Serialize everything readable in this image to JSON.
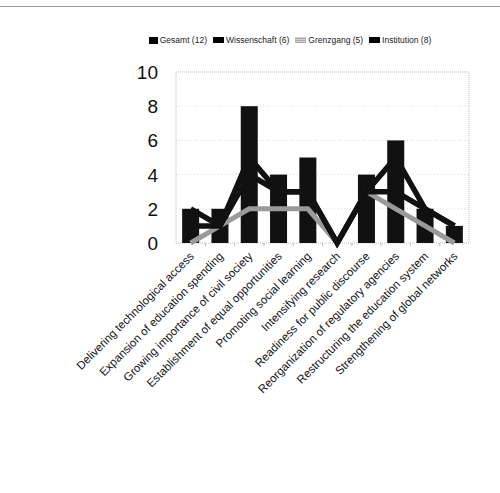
{
  "chart_data": {
    "type": "bar",
    "title": "",
    "xlabel": "",
    "ylabel": "",
    "ylim": [
      0,
      10
    ],
    "yticks": [
      0,
      2,
      4,
      6,
      8,
      10
    ],
    "grid": true,
    "legend_position": "top",
    "categories": [
      "Delivering technological access",
      "Expansion of education spending",
      "Growing importance of civil society",
      "Establishment of equal opportunities",
      "Promoting social learning",
      "Intensifying research",
      "Readiness for public discourse",
      "Reorganization of regulatory agencies",
      "Restructuring the education system",
      "Strengthening of global networks"
    ],
    "series": [
      {
        "name": "Gesamt (12)",
        "type": "bar",
        "color": "#111111",
        "values": [
          2,
          2,
          8,
          4,
          5,
          0,
          4,
          6,
          2,
          1
        ]
      },
      {
        "name": "Wissenschaft (6)",
        "type": "line",
        "color": "#111111",
        "values": [
          2,
          1,
          5,
          3,
          3,
          0,
          3,
          5,
          2,
          1
        ]
      },
      {
        "name": "Grenzgang (5)",
        "type": "line",
        "color": "#9a9a9a",
        "values": [
          0,
          1,
          2,
          2,
          2,
          0,
          3,
          2,
          1,
          0
        ]
      },
      {
        "name": "Institution (8)",
        "type": "line",
        "color": "#111111",
        "values": [
          1,
          1,
          4,
          3,
          3,
          0,
          3,
          3,
          2,
          1
        ]
      }
    ]
  },
  "legend": [
    {
      "label": "Gesamt (12)",
      "style": "black"
    },
    {
      "label": "Wissenschaft (6)",
      "style": "black-wide"
    },
    {
      "label": "Grenzgang (5)",
      "style": "grey"
    },
    {
      "label": "Institution (8)",
      "style": "black-wide"
    }
  ]
}
